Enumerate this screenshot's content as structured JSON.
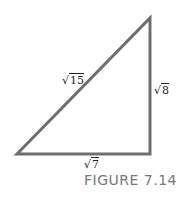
{
  "figure": {
    "caption": "FIGURE 7.14",
    "stroke_color": "#6e6e6e",
    "triangle": {
      "vertices": [
        [
          16,
          154
        ],
        [
          150,
          17
        ],
        [
          150,
          154
        ]
      ],
      "labels": {
        "hypotenuse": {
          "symbol": "√",
          "value": "15"
        },
        "vertical_leg": {
          "symbol": "√",
          "value": "8"
        },
        "horizontal_leg": {
          "symbol": "√",
          "value": "7"
        }
      }
    }
  }
}
